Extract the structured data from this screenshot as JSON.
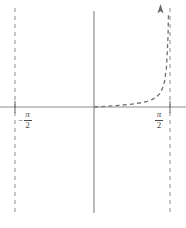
{
  "figure": {
    "title": "",
    "width": 186,
    "height": 228,
    "background_color": "#ffffff"
  },
  "axes": {
    "x_axis": {
      "name": "x-axis",
      "color": "#8c8c8c",
      "y_pixel": 107,
      "x_start_pixel": 0,
      "x_end_pixel": 186
    },
    "y_axis": {
      "name": "y-axis",
      "color": "#8c8c8c",
      "x_pixel": 94,
      "y_start_pixel": 11,
      "y_end_pixel": 213
    },
    "origin": {
      "x_pixel": 94,
      "y_pixel": 107
    }
  },
  "asymptotes": [
    {
      "name": "asymptote-left",
      "value": "-pi/2",
      "x_pixel": 15,
      "style": "dashed",
      "color": "#8c8c8c",
      "y_start_pixel": 8,
      "y_end_pixel": 214
    },
    {
      "name": "asymptote-right",
      "value": "pi/2",
      "x_pixel": 170,
      "style": "dashed",
      "color": "#8c8c8c",
      "y_start_pixel": 8,
      "y_end_pixel": 214
    }
  ],
  "ticks": [
    {
      "name": "tick-neg-half-pi",
      "x_pixel": 15,
      "y_pixel": 107
    },
    {
      "name": "tick-pos-half-pi",
      "x_pixel": 170,
      "y_pixel": 107
    }
  ],
  "labels": {
    "neg_half_pi": {
      "sign": "−",
      "numerator": "π",
      "denominator": "2",
      "plain": "−π/2"
    },
    "pos_half_pi": {
      "sign": "",
      "numerator": "π",
      "denominator": "2",
      "plain": "π/2"
    }
  },
  "chart_data": {
    "type": "line",
    "title": "",
    "xlabel": "",
    "ylabel": "",
    "xlim": [
      -1.5707963,
      1.5707963
    ],
    "ylim": [
      -1.85,
      1.85
    ],
    "grid": false,
    "legend": null,
    "curve_style": "dashed",
    "curve_color": "#707070",
    "arrow_end": "up",
    "series": [
      {
        "name": "y = tan(x)",
        "function": "tan",
        "domain": [
          0.0,
          1.5395
        ],
        "x": [
          0.0,
          0.15,
          0.3,
          0.45,
          0.6,
          0.75,
          0.9,
          1.0,
          1.1,
          1.2,
          1.28,
          1.35,
          1.41,
          1.46,
          1.5,
          1.53,
          1.5395
        ],
        "y": [
          0.0,
          0.151,
          0.309,
          0.483,
          0.684,
          0.932,
          1.26,
          1.557,
          1.965,
          2.572,
          3.34,
          4.455,
          6.17,
          8.99,
          14.1,
          24.5,
          32.2
        ]
      }
    ],
    "annotations": [
      {
        "name": "vertical-asymptote-left",
        "type": "vline",
        "x": -1.5707963,
        "label": "−π/2",
        "style": "dashed"
      },
      {
        "name": "vertical-asymptote-right",
        "type": "vline",
        "x": 1.5707963,
        "label": "π/2",
        "style": "dashed"
      }
    ],
    "tick_labels": {
      "x": [
        "−π/2",
        "π/2"
      ],
      "y": []
    }
  }
}
